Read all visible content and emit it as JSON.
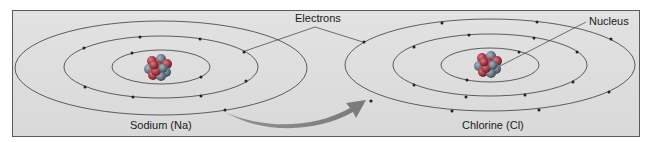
{
  "diagram": {
    "labels": {
      "electrons": "Electrons",
      "nucleus": "Nucleus"
    },
    "atoms": [
      {
        "name": "Sodium (Na)",
        "symbol": "Na",
        "shell_electrons": [
          2,
          8,
          1
        ]
      },
      {
        "name": "Chlorine (Cl)",
        "symbol": "Cl",
        "shell_electrons": [
          2,
          8,
          7
        ]
      }
    ],
    "transfer_arrow": "electron transfer from sodium outer shell to chlorine outer shell",
    "colors": {
      "background": "#dcdcdc",
      "orbit": "#3a3a3a",
      "nucleus_proton": "#b0424a",
      "nucleus_neutron": "#6f7f8f",
      "arrow": "#7a7a7a"
    }
  }
}
